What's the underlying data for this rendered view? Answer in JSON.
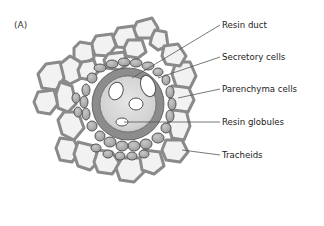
{
  "figure": {
    "panel_label": "(A)",
    "labels": [
      {
        "id": "resin-duct",
        "text": "Resin duct",
        "y": 20,
        "line": [
          132,
          78,
          220,
          25
        ]
      },
      {
        "id": "secretory-cells",
        "text": "Secretory cells",
        "y": 52,
        "line": [
          158,
          78,
          220,
          57
        ]
      },
      {
        "id": "parenchyma-cells",
        "text": "Parenchyma cells",
        "y": 84,
        "line": [
          178,
          98,
          220,
          89
        ]
      },
      {
        "id": "resin-globules",
        "text": "Resin globules",
        "y": 117,
        "line": [
          124,
          122,
          220,
          122
        ]
      },
      {
        "id": "tracheids",
        "text": "Tracheids",
        "y": 150,
        "line": [
          182,
          150,
          220,
          155
        ]
      }
    ],
    "colors": {
      "tracheid_fill": "#f2f2f2",
      "tracheid_wall": "#8a8a8a",
      "secretory_fill": "#a9a9a9",
      "parenchyma_fill": "#b8b8b8",
      "duct_fill": "#dcdcdc",
      "globule_fill": "#ffffff",
      "leader_line": "#555555"
    }
  }
}
